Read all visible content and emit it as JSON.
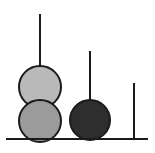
{
  "figure": {
    "title": "",
    "width": 155,
    "height": 153,
    "background_color": "#ffffff"
  },
  "chart_data": {
    "type": "scatter",
    "subtype": "stem-lollipop",
    "title": "",
    "xlabel": "",
    "ylabel": "",
    "grid": false,
    "legend": null,
    "axis": {
      "baseline_y": 139,
      "baseline_x_start": 6,
      "baseline_x_end": 148,
      "baseline_color": "#1a1a1a",
      "baseline_width": 2,
      "xlim": [
        0,
        155
      ],
      "ylim": [
        0,
        153
      ]
    },
    "categories": [
      "stem-1",
      "stem-2",
      "stem-3"
    ],
    "values": [
      124,
      88,
      56
    ],
    "stems": [
      {
        "name": "stem-1",
        "x": 40,
        "top_y": 14,
        "base_y": 139,
        "height": 125,
        "color": "#1a1a1a",
        "width": 2,
        "markers": [
          {
            "name": "marker-upper-left",
            "cx": 40,
            "cy": 87,
            "r": 21,
            "fill": "#b9b9b9",
            "stroke": "#1a1a1a",
            "stroke_width": 2
          },
          {
            "name": "marker-lower-left",
            "cx": 40,
            "cy": 121,
            "r": 21,
            "fill": "#9b9b9b",
            "stroke": "#1a1a1a",
            "stroke_width": 2
          }
        ]
      },
      {
        "name": "stem-2",
        "x": 90,
        "top_y": 51,
        "base_y": 139,
        "height": 88,
        "color": "#1a1a1a",
        "width": 2,
        "markers": [
          {
            "name": "marker-middle",
            "cx": 90,
            "cy": 120,
            "r": 20,
            "fill": "#2e2e2e",
            "stroke": "#1a1a1a",
            "stroke_width": 2
          }
        ]
      },
      {
        "name": "stem-3",
        "x": 134,
        "top_y": 83,
        "base_y": 139,
        "height": 56,
        "color": "#1a1a1a",
        "width": 2,
        "markers": []
      }
    ],
    "annotations": []
  },
  "colors": {
    "ink": "#1a1a1a",
    "marker_light": "#b9b9b9",
    "marker_mid": "#9b9b9b",
    "marker_dark": "#2e2e2e",
    "background": "#ffffff"
  }
}
